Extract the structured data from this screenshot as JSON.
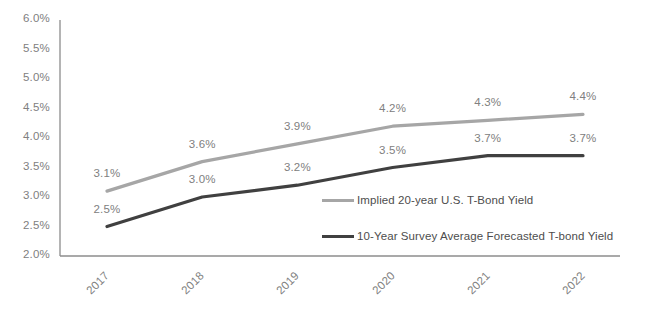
{
  "chart_data": {
    "type": "line",
    "title": "",
    "xlabel": "",
    "ylabel": "",
    "categories": [
      "2017",
      "2018",
      "2019",
      "2020",
      "2021",
      "2022"
    ],
    "ylim": [
      2.0,
      6.0
    ],
    "ytick_step": 0.5,
    "grid": false,
    "legend_position": "inside-bottom-right",
    "series": [
      {
        "name": "Implied 20-year U.S. T-Bond Yield",
        "color": "#a6a6a6",
        "values": [
          3.1,
          3.6,
          3.9,
          4.2,
          4.3,
          4.4
        ],
        "labels": [
          "3.1%",
          "3.6%",
          "3.9%",
          "4.2%",
          "4.3%",
          "4.4%"
        ]
      },
      {
        "name": "10-Year Survey Average Forecasted T-bond Yield",
        "color": "#404040",
        "values": [
          2.5,
          3.0,
          3.2,
          3.5,
          3.7,
          3.7
        ],
        "labels": [
          "2.5%",
          "3.0%",
          "3.2%",
          "3.5%",
          "3.7%",
          "3.7%"
        ]
      }
    ],
    "ytick_labels": [
      "6.0%",
      "5.5%",
      "5.0%",
      "4.5%",
      "4.0%",
      "3.5%",
      "3.0%",
      "2.5%",
      "2.0%"
    ],
    "axis_color": "#808080",
    "tick_label_color": "#808080",
    "data_label_color": "#808080",
    "legend_text_color": "#4d4d4d"
  },
  "legend": {
    "items": [
      {
        "label": "Implied 20-year U.S. T-Bond Yield",
        "color": "#a6a6a6"
      },
      {
        "label": "10-Year Survey Average Forecasted T-bond Yield",
        "color": "#404040"
      }
    ]
  }
}
